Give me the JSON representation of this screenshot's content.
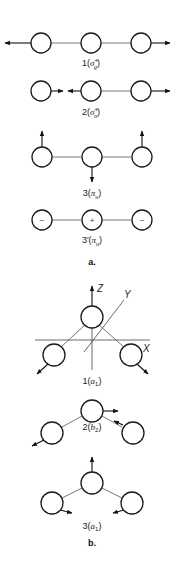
{
  "figure": {
    "panel_a": {
      "label": "a.",
      "modes": [
        {
          "index": "1",
          "symmetry": "σ",
          "sub": "g",
          "sup": "+",
          "full": "1(σg+)",
          "description": "symmetric stretch: outer atoms move outward"
        },
        {
          "index": "2",
          "symmetry": "σ",
          "sub": "u",
          "sup": "+",
          "full": "2(σu+)",
          "description": "antisymmetric stretch"
        },
        {
          "index": "3",
          "symmetry": "π",
          "sub": "u",
          "sup": "",
          "full": "3(πu)",
          "description": "bending: outer atoms up, center down"
        },
        {
          "index": "3′",
          "symmetry": "π",
          "sub": "u",
          "sup": "",
          "full": "3′(πu)",
          "description": "degenerate bend out of plane",
          "signs": [
            "−",
            "+",
            "−"
          ]
        }
      ]
    },
    "panel_b": {
      "label": "b.",
      "axes": {
        "z": "Z",
        "y": "Y",
        "x": "X"
      },
      "modes": [
        {
          "index": "1",
          "symmetry": "a",
          "sub": "1",
          "full": "1(a1)"
        },
        {
          "index": "2",
          "symmetry": "b",
          "sub": "2",
          "full": "2(b2)"
        },
        {
          "index": "3",
          "symmetry": "a",
          "sub": "1",
          "full": "3(a1)"
        }
      ]
    }
  },
  "colors": {
    "line": "#1a1a1a",
    "bond": "#555555",
    "background": "#ffffff"
  }
}
